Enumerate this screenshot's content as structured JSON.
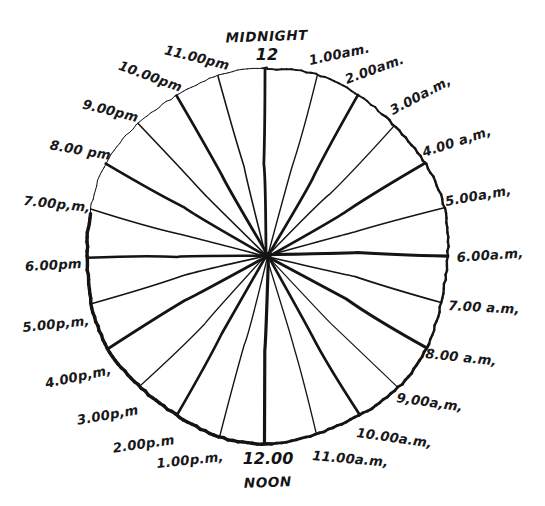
{
  "figure": {
    "kind": "hand-drawn-24-hour-clock-face",
    "background_color": "#ffffff",
    "ink_color": "#141416",
    "center_x": 267,
    "center_y": 256,
    "radius": 184,
    "spoke_count": 24
  },
  "top_caption": {
    "word": "MIDNIGHT",
    "number": "12"
  },
  "bottom_caption": {
    "number": "12.00",
    "word": "NOON"
  },
  "hours": [
    {
      "label": "12",
      "hour": 0,
      "angle_deg": 0,
      "label_x": 267,
      "label_y": 60,
      "anchor": "middle",
      "rotate": 0,
      "weight": "thick"
    },
    {
      "label": "1.00am.",
      "hour": 1,
      "angle_deg": 15,
      "label_x": 310,
      "label_y": 65,
      "anchor": "start",
      "rotate": -12,
      "weight": "thin"
    },
    {
      "label": "2.00am.",
      "hour": 2,
      "angle_deg": 30,
      "label_x": 347,
      "label_y": 84,
      "anchor": "start",
      "rotate": -20,
      "weight": "thick"
    },
    {
      "label": "3.00a.m,",
      "hour": 3,
      "angle_deg": 45,
      "label_x": 393,
      "label_y": 115,
      "anchor": "start",
      "rotate": -28,
      "weight": "thin"
    },
    {
      "label": "4.00 a,m,",
      "hour": 4,
      "angle_deg": 60,
      "label_x": 424,
      "label_y": 157,
      "anchor": "start",
      "rotate": -18,
      "weight": "thick"
    },
    {
      "label": "5.00a,m,",
      "hour": 5,
      "angle_deg": 75,
      "label_x": 446,
      "label_y": 206,
      "anchor": "start",
      "rotate": -10,
      "weight": "thin"
    },
    {
      "label": "6.00a.m,",
      "hour": 6,
      "angle_deg": 90,
      "label_x": 457,
      "label_y": 262,
      "anchor": "start",
      "rotate": -4,
      "weight": "thick"
    },
    {
      "label": "7.00 a.m,",
      "hour": 7,
      "angle_deg": 105,
      "label_x": 448,
      "label_y": 310,
      "anchor": "start",
      "rotate": 3,
      "weight": "thin"
    },
    {
      "label": "8.00 a.m,",
      "hour": 8,
      "angle_deg": 120,
      "label_x": 425,
      "label_y": 358,
      "anchor": "start",
      "rotate": 6,
      "weight": "thick"
    },
    {
      "label": "9,00a,m,",
      "hour": 9,
      "angle_deg": 135,
      "label_x": 396,
      "label_y": 402,
      "anchor": "start",
      "rotate": 8,
      "weight": "thin"
    },
    {
      "label": "10.00a.m,",
      "hour": 10,
      "angle_deg": 150,
      "label_x": 356,
      "label_y": 437,
      "anchor": "start",
      "rotate": 8,
      "weight": "thick"
    },
    {
      "label": "11.00a.m,",
      "hour": 11,
      "angle_deg": 165,
      "label_x": 312,
      "label_y": 460,
      "anchor": "start",
      "rotate": 5,
      "weight": "thin"
    },
    {
      "label": "12.00",
      "hour": 12,
      "angle_deg": 180,
      "label_x": 268,
      "label_y": 464,
      "anchor": "middle",
      "rotate": 0,
      "weight": "thick"
    },
    {
      "label": "1.00p.m,",
      "hour": 13,
      "angle_deg": 195,
      "label_x": 224,
      "label_y": 461,
      "anchor": "end",
      "rotate": -6,
      "weight": "thin"
    },
    {
      "label": "2.00p.m",
      "hour": 14,
      "angle_deg": 210,
      "label_x": 175,
      "label_y": 444,
      "anchor": "end",
      "rotate": -8,
      "weight": "thick"
    },
    {
      "label": "3.00p,m",
      "hour": 15,
      "angle_deg": 225,
      "label_x": 139,
      "label_y": 414,
      "anchor": "end",
      "rotate": -10,
      "weight": "thin"
    },
    {
      "label": "4.00p,m,",
      "hour": 16,
      "angle_deg": 240,
      "label_x": 112,
      "label_y": 374,
      "anchor": "end",
      "rotate": -12,
      "weight": "thick"
    },
    {
      "label": "5.00p,m,",
      "hour": 17,
      "angle_deg": 255,
      "label_x": 90,
      "label_y": 325,
      "anchor": "end",
      "rotate": -6,
      "weight": "thin"
    },
    {
      "label": "6.00pm",
      "hour": 18,
      "angle_deg": 270,
      "label_x": 82,
      "label_y": 268,
      "anchor": "end",
      "rotate": -3,
      "weight": "thick"
    },
    {
      "label": "7.00p,m,",
      "hour": 19,
      "angle_deg": 285,
      "label_x": 90,
      "label_y": 212,
      "anchor": "end",
      "rotate": 6,
      "weight": "thin"
    },
    {
      "label": "8.00 pm",
      "hour": 20,
      "angle_deg": 300,
      "label_x": 110,
      "label_y": 160,
      "anchor": "end",
      "rotate": 10,
      "weight": "thick"
    },
    {
      "label": "9.00pm",
      "hour": 21,
      "angle_deg": 315,
      "label_x": 137,
      "label_y": 122,
      "anchor": "end",
      "rotate": 14,
      "weight": "thin"
    },
    {
      "label": "10.00pm",
      "hour": 22,
      "angle_deg": 330,
      "label_x": 180,
      "label_y": 92,
      "anchor": "end",
      "rotate": 20,
      "weight": "thick"
    },
    {
      "label": "11.00pm",
      "hour": 23,
      "angle_deg": 345,
      "label_x": 228,
      "label_y": 70,
      "anchor": "end",
      "rotate": 14,
      "weight": "thin"
    }
  ]
}
